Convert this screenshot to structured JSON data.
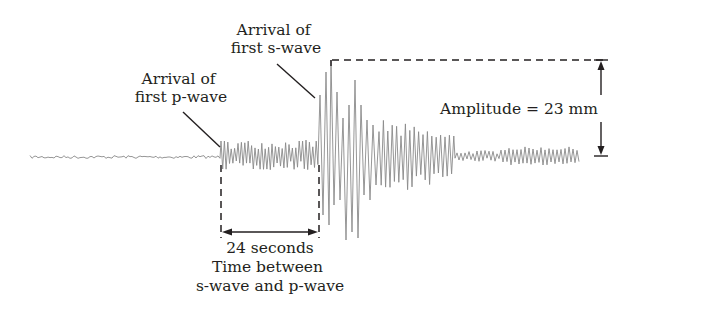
{
  "figure": {
    "type": "seismogram",
    "labels": {
      "p_wave": [
        "Arrival of",
        "first p-wave"
      ],
      "s_wave": [
        "Arrival of",
        "first s-wave"
      ],
      "amplitude": "Amplitude = 23 mm",
      "interval_value": "24 seconds",
      "interval_caption": [
        "Time between",
        "s-wave and p-wave"
      ]
    },
    "measurements": {
      "amplitude_mm": 23,
      "s_minus_p_seconds": 24
    },
    "colors": {
      "trace": "#8a8a8a",
      "annotation": "#231f20",
      "background": "#ffffff"
    }
  }
}
